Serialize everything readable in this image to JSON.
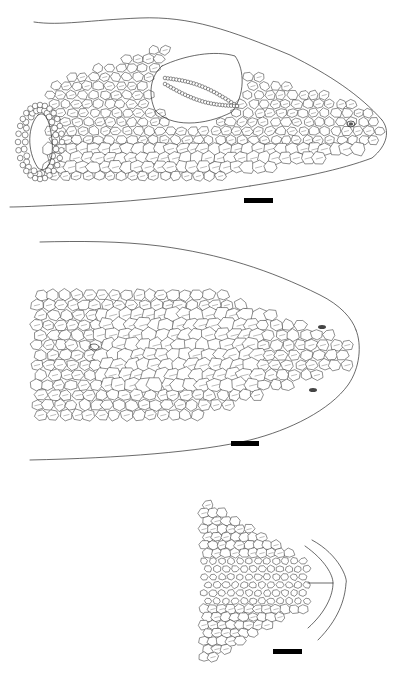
{
  "figure": {
    "description": "Line drawings of lizard head scalation in three views",
    "panels": [
      {
        "id": "lateral",
        "view": "lateral view of head",
        "scale_bar": {
          "x": 244,
          "y": 198,
          "w": 29,
          "h": 5
        }
      },
      {
        "id": "dorsal",
        "view": "dorsal view of head",
        "scale_bar": {
          "x": 231,
          "y": 441,
          "w": 28,
          "h": 5
        }
      },
      {
        "id": "ventral",
        "view": "ventral view of chin",
        "scale_bar": {
          "x": 273,
          "y": 649,
          "w": 29,
          "h": 5
        }
      }
    ],
    "colors": {
      "line": "#2a2a2a",
      "background": "#ffffff",
      "scale_bar": "#000000"
    }
  }
}
